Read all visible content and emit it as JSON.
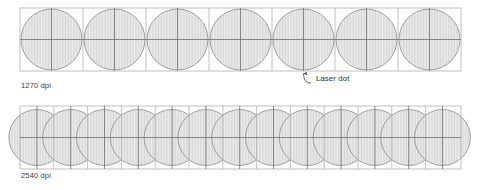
{
  "figure": {
    "type": "diagram",
    "background": "#ffffff",
    "colors": {
      "cell_border": "#a8a8a8",
      "dot_outline": "#7d7d7d",
      "dot_fill": "#e8e8e8",
      "stripe": "#d2d2d2",
      "crosshair": "#6e6e6e",
      "text": "#3d3d3d",
      "leader": "#4a4a4a"
    },
    "rows": [
      {
        "id": "row-1270",
        "caption": "1270 dpi",
        "cell_count": 7,
        "cell_size": 63,
        "dot_diameter": 61,
        "dot_spacing": 63,
        "overlap": false,
        "origin_x": 20,
        "origin_y": 8
      },
      {
        "id": "row-2540",
        "caption": "2540 dpi",
        "cell_count": 13,
        "cell_size": 33.8,
        "dot_diameter": 56,
        "dot_spacing": 33.8,
        "overlap": true,
        "origin_x": 20,
        "origin_y": 106
      }
    ],
    "annotation": {
      "label": "Laser dot",
      "target_row": "row-1270",
      "target_cell_index": 4,
      "arrow": "curved-leader-up"
    }
  }
}
